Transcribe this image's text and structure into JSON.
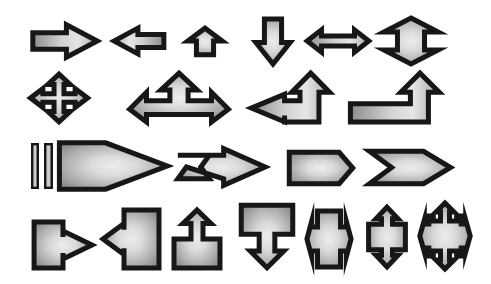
{
  "canvas": {
    "width": 491,
    "height": 284,
    "background_color": "#ffffff",
    "title": "Arrow and callout shape gallery"
  },
  "style": {
    "outline_color": "#17171a",
    "gradient_center_color": "#e8e8e8",
    "gradient_mid_color": "#b9b9b9",
    "gradient_edge_color": "#8c8c8c",
    "outline_width_label": "5"
  },
  "rows": [
    {
      "index": 1,
      "label": "Basic directional arrows"
    },
    {
      "index": 2,
      "label": "Multi-direction and bent arrows"
    },
    {
      "index": 3,
      "label": "Striped, notched and banner arrows"
    },
    {
      "index": 4,
      "label": "Callout arrows"
    }
  ],
  "shapes": [
    {
      "id": "right-arrow",
      "name": "Right Arrow",
      "row": 1,
      "col": 1,
      "x": 30,
      "y": 22,
      "width": 70,
      "height": 38,
      "viewbox": "0 0 100 56",
      "points": "4,16 52,16 52,4 96,28 52,52 52,40 4,40",
      "gradient": "linear-lr"
    },
    {
      "id": "left-arrow",
      "name": "Left Arrow",
      "row": 1,
      "col": 2,
      "x": 112,
      "y": 26,
      "width": 54,
      "height": 30,
      "viewbox": "0 0 100 56",
      "points": "96,16 48,16 48,4 4,28 48,52 48,40 96,40",
      "gradient": "linear-rl"
    },
    {
      "id": "up-arrow",
      "name": "Up Arrow",
      "row": 1,
      "col": 3,
      "x": 185,
      "y": 27,
      "width": 40,
      "height": 29,
      "viewbox": "0 0 56 100",
      "points": "16,96 16,48 4,48 28,4 52,48 40,48 40,96",
      "gradient": "radial"
    },
    {
      "id": "down-arrow",
      "name": "Down Arrow",
      "row": 1,
      "col": 4,
      "x": 253,
      "y": 17,
      "width": 40,
      "height": 49,
      "viewbox": "0 0 56 100",
      "points": "16,4 16,52 4,52 28,96 52,52 40,52 40,4",
      "gradient": "radial"
    },
    {
      "id": "left-right-arrow",
      "name": "Left Right Arrow",
      "row": 1,
      "col": 5,
      "x": 305,
      "y": 28,
      "width": 66,
      "height": 26,
      "viewbox": "0 0 120 56",
      "points": "4,28 30,4 30,17 90,17 90,4 116,28 90,52 90,39 30,39 30,52",
      "gradient": "linear-lr"
    },
    {
      "id": "up-down-arrow",
      "name": "Up Down Arrow",
      "row": 1,
      "col": 6,
      "x": 382,
      "y": 16,
      "width": 58,
      "height": 50,
      "viewbox": "0 0 120 100",
      "points": "60,4 116,32 88,32 88,68 116,68 60,96 4,68 32,68 32,32 4,32",
      "gradient": "radial"
    },
    {
      "id": "quad-arrow",
      "name": "Quad Arrow",
      "row": 2,
      "col": 1,
      "x": 28,
      "y": 72,
      "width": 62,
      "height": 52,
      "viewbox": "0 0 100 100",
      "points": "50,4 68,24 58,24 58,42 76,42 76,32 96,50 76,68 76,58 58,58 58,76 68,76 50,96 32,76 42,76 42,58 24,58 24,68 4,50 24,32 24,42 42,42 42,24 32,24",
      "gradient": "radial"
    },
    {
      "id": "left-up-right-arrow",
      "name": "Left Up Right Arrow",
      "row": 2,
      "col": 2,
      "x": 127,
      "y": 71,
      "width": 104,
      "height": 53,
      "viewbox": "0 0 160 100",
      "points": "80,4 108,36 94,36 94,56 130,56 130,40 156,72 130,96 130,82 30,82 30,96 4,72 30,40 30,56 66,56 66,36 52,36",
      "gradient": "radial"
    },
    {
      "id": "bent-left-up-arrow",
      "name": "Bent Arrow Left Up",
      "row": 2,
      "col": 3,
      "x": 249,
      "y": 71,
      "width": 83,
      "height": 53,
      "viewbox": "0 0 140 100",
      "points": "104,4 136,40 118,40 118,96 60,96 60,96 60,84 60,84 60,96 4,70 60,44 60,56 86,56 86,40 72,40",
      "gradient": "linear-lr"
    },
    {
      "id": "bent-up-arrow",
      "name": "Bent Arrow Up",
      "row": 2,
      "col": 4,
      "x": 348,
      "y": 71,
      "width": 96,
      "height": 53,
      "viewbox": "0 0 160 100",
      "points": "120,4 152,40 134,40 134,96 4,96 4,62 104,62 104,40 88,40",
      "gradient": "linear-lr"
    },
    {
      "id": "striped-right-arrow",
      "name": "Striped Right Arrow",
      "row": 3,
      "col": 1,
      "x": 30,
      "y": 140,
      "width": 140,
      "height": 52,
      "viewbox": "0 0 200 74",
      "stripe_bars": 2,
      "points": "42,4 108,4 196,37 108,70 42,70",
      "gradient": "radial"
    },
    {
      "id": "notched-right-arrow",
      "name": "Notched Right Arrow",
      "row": 3,
      "col": 2,
      "x": 175,
      "y": 146,
      "width": 93,
      "height": 42,
      "viewbox": "0 0 130 64",
      "points": "4,14 48,14 36,32 48,50 4,50 16,32 68,50 68,60 126,32 68,4 68,14",
      "gradient": "radial"
    },
    {
      "id": "pentagon-banner",
      "name": "Pentagon",
      "row": 3,
      "col": 3,
      "x": 287,
      "y": 150,
      "width": 68,
      "height": 36,
      "viewbox": "0 0 120 64",
      "points": "4,4 92,4 116,32 92,60 4,60",
      "gradient": "radial"
    },
    {
      "id": "chevron",
      "name": "Chevron",
      "row": 3,
      "col": 4,
      "x": 367,
      "y": 149,
      "width": 86,
      "height": 37,
      "viewbox": "0 0 140 64",
      "points": "4,4 92,4 136,32 92,60 4,60 40,32",
      "gradient": "radial"
    },
    {
      "id": "right-arrow-callout",
      "name": "Right Arrow Callout",
      "row": 4,
      "col": 1,
      "x": 32,
      "y": 220,
      "width": 62,
      "height": 50,
      "viewbox": "0 0 120 100",
      "points": "4,4 60,4 60,34 60,34 60,22 116,50 60,78 60,66 60,66 60,96 4,96",
      "gradient": "radial"
    },
    {
      "id": "left-arrow-callout",
      "name": "Left Arrow Callout",
      "row": 4,
      "col": 2,
      "x": 101,
      "y": 208,
      "width": 60,
      "height": 62,
      "viewbox": "0 0 120 120",
      "points": "116,4 46,4 46,42 46,30 4,60 46,90 46,78 46,116 116,116",
      "gradient": "radial"
    },
    {
      "id": "up-arrow-callout",
      "name": "Up Arrow Callout",
      "row": 4,
      "col": 3,
      "x": 172,
      "y": 208,
      "width": 50,
      "height": 62,
      "viewbox": "0 0 100 120",
      "points": "4,60 38,60 38,30 22,30 50,4 78,30 62,30 62,60 96,60 96,116 4,116",
      "gradient": "radial"
    },
    {
      "id": "down-arrow-callout",
      "name": "Down Arrow Callout",
      "row": 4,
      "col": 4,
      "x": 239,
      "y": 203,
      "width": 56,
      "height": 67,
      "viewbox": "0 0 100 120",
      "points": "4,4 96,4 96,56 64,56 64,86 80,86 50,116 20,86 36,86 36,56 4,56",
      "gradient": "radial"
    },
    {
      "id": "left-right-arrow-callout",
      "name": "Left Right Arrow Callout",
      "row": 4,
      "col": 5,
      "x": 305,
      "y": 209,
      "width": 48,
      "height": 60,
      "viewbox": "0 0 100 120",
      "points": "26,4 74,4 74,36 86,36 86,24 96,60 86,96 86,84 74,84 74,116 26,116 26,84 14,84 14,96 4,60 14,24 14,36 26,36",
      "gradient": "radial"
    },
    {
      "id": "up-down-arrow-callout",
      "name": "Up Down Arrow Callout",
      "row": 4,
      "col": 6,
      "x": 364,
      "y": 205,
      "width": 46,
      "height": 64,
      "viewbox": "0 0 100 120",
      "points": "50,4 74,26 62,26 62,36 90,36 90,84 62,84 62,94 74,94 50,116 26,94 38,94 38,84 10,84 10,36 38,36 38,26 26,26",
      "gradient": "radial"
    },
    {
      "id": "quad-arrow-callout",
      "name": "Quad Arrow Callout",
      "row": 4,
      "col": 7,
      "x": 418,
      "y": 201,
      "width": 54,
      "height": 70,
      "viewbox": "0 0 120 140",
      "points": "60,4 80,22 70,22 70,40 86,40 86,30 96,30 96,46 106,46 106,38 116,70 106,102 106,94 96,94 96,110 86,110 86,100 70,100 70,118 80,118 60,136 40,118 50,118 50,100 34,100 34,110 24,110 24,94 14,94 14,102 4,70 14,38 14,46 24,46 24,30 34,30 34,40 50,40 50,22 40,22",
      "gradient": "radial"
    }
  ],
  "stripes": [
    {
      "id": "stripe-bar-1",
      "x": 31,
      "y": 143,
      "width": 8,
      "height": 46
    },
    {
      "id": "stripe-bar-2",
      "x": 44,
      "y": 143,
      "width": 9,
      "height": 46
    }
  ]
}
